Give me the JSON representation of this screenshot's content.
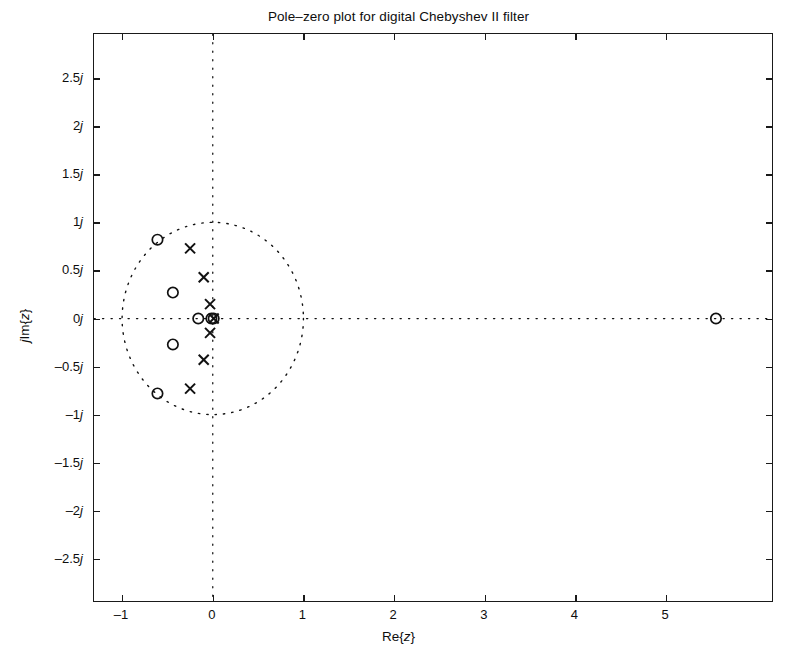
{
  "chart_data": {
    "type": "scatter",
    "title": "Pole–zero plot for digital Chebyshev II filter",
    "xlabel": "Re{z}",
    "ylabel": "jIm{z}",
    "xlim": [
      -1.31,
      6.19
    ],
    "ylim": [
      -2.96,
      2.96
    ],
    "xticks": [
      -1,
      0,
      1,
      2,
      3,
      4,
      5
    ],
    "xticklabels": [
      "-1",
      "0",
      "1",
      "2",
      "3",
      "4",
      "5"
    ],
    "yticks": [
      -2.5,
      -2,
      -1.5,
      -1,
      -0.5,
      0,
      0.5,
      1,
      1.5,
      2,
      2.5
    ],
    "yticklabels": [
      "-2.5j",
      "-2j",
      "-1.5j",
      "-1j",
      "-0.5j",
      "0j",
      "0.5j",
      "1j",
      "1.5j",
      "2j",
      "2.5j"
    ],
    "grid": false,
    "legend": null,
    "unit_circle": {
      "radius": 1.0,
      "center": [
        0,
        0
      ],
      "style": "dotted"
    },
    "reference_axes": {
      "style": "dotted",
      "x_axis": true,
      "y_axis": true
    },
    "series": [
      {
        "name": "zeros",
        "marker": "o",
        "values": [
          {
            "re": -0.61,
            "im": 0.82
          },
          {
            "re": -0.44,
            "im": 0.27
          },
          {
            "re": -0.44,
            "im": -0.27
          },
          {
            "re": -0.61,
            "im": -0.78
          },
          {
            "re": -0.16,
            "im": 0.0
          },
          {
            "re": -0.015,
            "im": 0.0
          },
          {
            "re": 0.01,
            "im": 0.0
          },
          {
            "re": 5.55,
            "im": 0.0
          }
        ]
      },
      {
        "name": "poles",
        "marker": "x",
        "values": [
          {
            "re": -0.25,
            "im": 0.73
          },
          {
            "re": -0.1,
            "im": 0.43
          },
          {
            "re": -0.03,
            "im": 0.15
          },
          {
            "re": 0.01,
            "im": 0.0
          },
          {
            "re": -0.03,
            "im": -0.15
          },
          {
            "re": -0.1,
            "im": -0.43
          },
          {
            "re": -0.25,
            "im": -0.73
          }
        ]
      }
    ]
  },
  "figure": {
    "title": "Pole–zero plot for digital Chebyshev II filter",
    "xlabel_prefix": "Re{",
    "xlabel_var": "z",
    "xlabel_suffix": "}",
    "ylabel_j": "j",
    "ylabel_prefix": "Im{",
    "ylabel_var": "z",
    "ylabel_suffix": "}",
    "marker_color": "#111111",
    "axis_color": "#1a1a1a",
    "background": "#ffffff"
  }
}
